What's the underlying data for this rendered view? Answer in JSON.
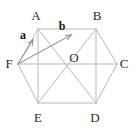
{
  "figure": {
    "type": "geometry-diagram",
    "shape": "regular-hexagon",
    "canvas": {
      "width": 134,
      "height": 129
    },
    "colors": {
      "background": "#ffffff",
      "edge_stroke": "#b9b9b9",
      "diagonal_stroke": "#b9b9b9",
      "vector_stroke": "#9a9a9a",
      "label_text": "#2b2b2b",
      "vector_label_text": "#141414"
    },
    "vertices": [
      {
        "name": "A",
        "label": "A",
        "x": 38,
        "y": 29,
        "label_x": 36,
        "label_y": 15
      },
      {
        "name": "B",
        "label": "B",
        "x": 96,
        "y": 29,
        "label_x": 97,
        "label_y": 15
      },
      {
        "name": "C",
        "label": "C",
        "x": 117,
        "y": 64,
        "label_x": 124,
        "label_y": 63
      },
      {
        "name": "D",
        "label": "D",
        "x": 96,
        "y": 103,
        "label_x": 95,
        "label_y": 117
      },
      {
        "name": "E",
        "label": "E",
        "x": 38,
        "y": 103,
        "label_x": 38,
        "label_y": 117
      },
      {
        "name": "F",
        "label": "F",
        "x": 18,
        "y": 64,
        "label_x": 9,
        "label_y": 63
      }
    ],
    "centre": {
      "name": "O",
      "label": "O",
      "x": 66,
      "y": 64,
      "label_x": 74,
      "label_y": 57
    },
    "edges": [
      {
        "from": "A",
        "to": "B"
      },
      {
        "from": "B",
        "to": "C"
      },
      {
        "from": "C",
        "to": "D"
      },
      {
        "from": "D",
        "to": "E"
      },
      {
        "from": "E",
        "to": "F"
      },
      {
        "from": "F",
        "to": "A"
      }
    ],
    "diagonals": [
      {
        "from": "F",
        "to": "C",
        "note": "long diagonal through O"
      },
      {
        "from": "A",
        "to": "D",
        "note": "long diagonal through O"
      },
      {
        "from": "B",
        "to": "E",
        "note": "long diagonal through O"
      },
      {
        "from": "A",
        "to": "E",
        "note": "short diagonal"
      },
      {
        "from": "B",
        "to": "D",
        "note": "short diagonal"
      }
    ],
    "vectors": [
      {
        "name": "a",
        "label": "a",
        "from": "F",
        "to": "A",
        "from_x": 18,
        "from_y": 64,
        "to_x": 33,
        "to_y": 40,
        "label_x": 23,
        "label_y": 35
      },
      {
        "name": "b",
        "label": "b",
        "from": "F",
        "to": "B",
        "from_x": 18,
        "from_y": 64,
        "to_x": 71,
        "to_y": 35,
        "label_x": 62,
        "label_y": 26
      }
    ]
  }
}
